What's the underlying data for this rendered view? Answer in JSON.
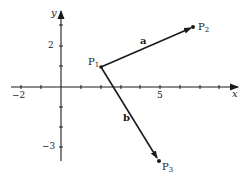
{
  "diagram": {
    "type": "vector-diagram",
    "axes": {
      "x_label": "x",
      "y_label": "y",
      "x_range": [
        -2,
        8
      ],
      "y_range": [
        -3,
        3
      ],
      "x_tick_labels": [
        {
          "value": -2,
          "text": "−2"
        },
        {
          "value": 5,
          "text": "5"
        }
      ],
      "y_tick_labels": [
        {
          "value": 2,
          "text": "2"
        },
        {
          "value": -3,
          "text": "−3"
        }
      ]
    },
    "points": [
      {
        "id": "P1",
        "name": "P",
        "sub": "1",
        "x": 2,
        "y": 1
      },
      {
        "id": "P2",
        "name": "P",
        "sub": "2",
        "x": 6.6,
        "y": 2.9
      },
      {
        "id": "P3",
        "name": "P",
        "sub": "3",
        "x": 4.9,
        "y": -3.6
      }
    ],
    "vectors": [
      {
        "label": "a",
        "from": "P1",
        "to": "P2"
      },
      {
        "label": "b",
        "from": "P1",
        "to": "P3"
      }
    ],
    "colors": {
      "ink": "#1a1a1a",
      "background": "#ffffff"
    }
  }
}
